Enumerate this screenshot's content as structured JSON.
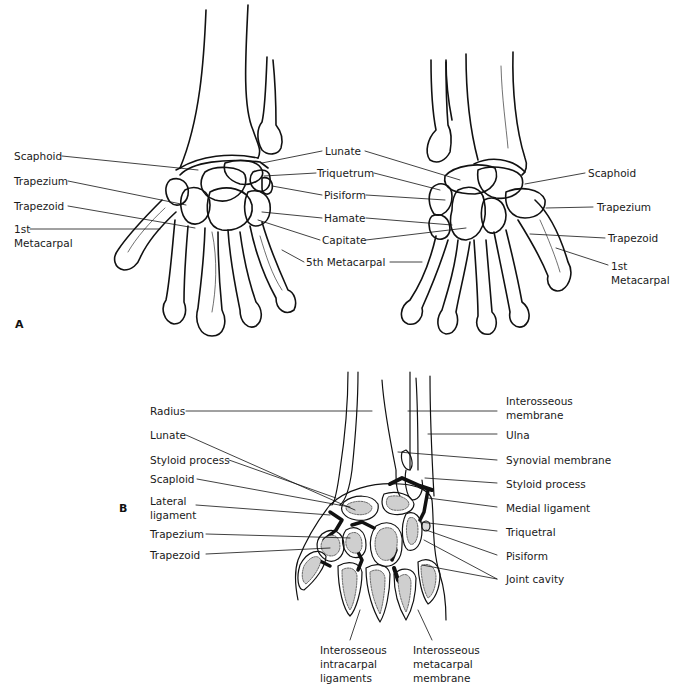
{
  "panel_a": {
    "letter": "A",
    "left_hand_labels": {
      "scaphoid": "Scaphoid",
      "trapezium": "Trapezium",
      "trapezoid": "Trapezoid",
      "first_metacarpal": "1st\nMetacarpal"
    },
    "center_labels": {
      "lunate": "Lunate",
      "triquetrum": "Triquetrum",
      "pisiform": "Pisiform",
      "hamate": "Hamate",
      "capitate": "Capitate",
      "fifth_metacarpal": "5th Metacarpal"
    },
    "right_hand_labels": {
      "scaphoid": "Scaphoid",
      "trapezium": "Trapezium",
      "trapezoid": "Trapezoid",
      "first_metacarpal": "1st\nMetacarpal"
    }
  },
  "panel_b": {
    "letter": "B",
    "left_labels": {
      "radius": "Radius",
      "lunate": "Lunate",
      "styloid_process": "Styloid process",
      "scaploid": "Scaploid",
      "lateral_ligament": "Lateral\nligament",
      "trapezium": "Trapezium",
      "trapezoid": "Trapezoid"
    },
    "right_labels": {
      "interosseous_membrane": "Interosseous\nmembrane",
      "ulna": "Ulna",
      "synovial_membrane": "Synovial membrane",
      "styloid_process": "Styloid process",
      "medial_ligament": "Medial ligament",
      "triquetral": "Triquetral",
      "pisiform": "Pisiform",
      "joint_cavity": "Joint cavity"
    },
    "bottom_labels": {
      "interosseous_intracarpal_ligaments": "Interosseous\nintracarpal\nligaments",
      "interosseous_metacarpal_membrane": "Interosseous\nmetacarpal\nmembrane"
    }
  }
}
